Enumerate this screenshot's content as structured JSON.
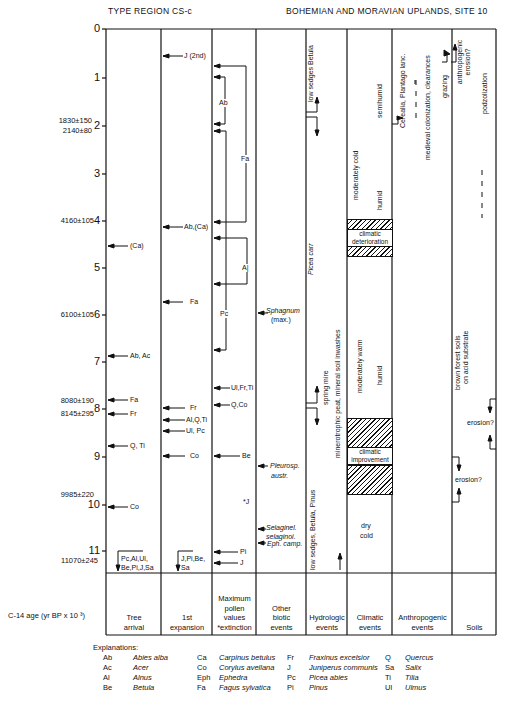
{
  "header": {
    "left_title": "TYPE REGION CS-c",
    "right_title": "BOHEMIAN AND MORAVIAN UPLANDS, SITE 10"
  },
  "axis": {
    "label": "C-14 age (yr BP x 10 ³)",
    "ticks": [
      "0",
      "1",
      "2",
      "3",
      "4",
      "5",
      "6",
      "7",
      "8",
      "9",
      "10",
      "11"
    ]
  },
  "dates": [
    {
      "text": "1830±150",
      "age": 1.83
    },
    {
      "text": "2140±80",
      "age": 2.14
    },
    {
      "text": "4160±105",
      "age": 4.16
    },
    {
      "text": "6100±105",
      "age": 6.1
    },
    {
      "text": "8080±190",
      "age": 8.08
    },
    {
      "text": "8145±295",
      "age": 8.145
    },
    {
      "text": "9985±220",
      "age": 9.985
    },
    {
      "text": "11070±245",
      "age": 11.07
    }
  ],
  "columns": [
    {
      "id": "tree-arrival",
      "label": "Tree\narrival"
    },
    {
      "id": "first-expansion",
      "label": "1st\nexpansion"
    },
    {
      "id": "max-pollen",
      "label": "Maximum\npollen\nvalues\n*extinction"
    },
    {
      "id": "other-biotic",
      "label": "Other\nbiotic\nevents"
    },
    {
      "id": "hydrologic",
      "label": "Hydrologic\nevents"
    },
    {
      "id": "climatic",
      "label": "Climatic\nevents"
    },
    {
      "id": "anthropogenic",
      "label": "Anthropogenic\nevents"
    },
    {
      "id": "soils",
      "label": "Soils"
    }
  ],
  "tree_arrival": [
    {
      "text": "(Ca)",
      "age": 4.55
    },
    {
      "text": "Ab, Ac",
      "age": 6.9
    },
    {
      "text": "Fa",
      "age": 7.85
    },
    {
      "text": "Fr",
      "age": 8.15
    },
    {
      "text": "Q, Ti",
      "age": 8.8
    },
    {
      "text": "Co",
      "age": 10.1
    },
    {
      "text": "Pc,Al,Ul,",
      "age": 11.2
    },
    {
      "text": "Be,Pi,J,Sa",
      "age": 11.4
    }
  ],
  "first_expansion": [
    {
      "text": "J (2nd)",
      "age": 0.55
    },
    {
      "text": "Ab,(Ca)",
      "age": 4.15
    },
    {
      "text": "Fa",
      "age": 5.75
    },
    {
      "text": "Fr",
      "age": 8.05
    },
    {
      "text": "Al,Q,Ti",
      "age": 8.3
    },
    {
      "text": "Ul, Pc",
      "age": 8.5
    },
    {
      "text": "Co",
      "age": 9.0
    },
    {
      "text": "J,Pi,Be,",
      "age": 11.2
    },
    {
      "text": "Sa",
      "age": 11.4
    }
  ],
  "max_pollen": [
    {
      "text": "Ab",
      "age": 1.5
    },
    {
      "text": "Fa",
      "age": 2.7
    },
    {
      "text": "A|",
      "age": 5.0
    },
    {
      "text": "Pc",
      "age": 6.0
    },
    {
      "text": "Ul,Fr,Ti",
      "age": 7.6
    },
    {
      "text": "Q,Co",
      "age": 7.95
    },
    {
      "text": "Be",
      "age": 9.0
    },
    {
      "text": "*J",
      "age": 9.95
    },
    {
      "text": "Pi",
      "age": 11.05
    },
    {
      "text": "J",
      "age": 11.3
    }
  ],
  "other_biotic": [
    {
      "text": "Sphagnum",
      "sub": "(max.)",
      "age": 5.95
    },
    {
      "text": "Pleurosp.",
      "sub": "austr.",
      "age": 9.2
    },
    {
      "text": "Selaginel.",
      "sub": "selaginoi.",
      "age": 10.6
    },
    {
      "text": "Eph. camp.",
      "age": 10.85
    }
  ],
  "hydrologic": [
    {
      "text": "low sedges Betula"
    },
    {
      "text": "Picea carr"
    },
    {
      "text": "spring mire"
    },
    {
      "text": "minerotrophic peat, mineral soil inwashes"
    },
    {
      "text": "low sedges, Betula, Pinus"
    }
  ],
  "climatic": [
    {
      "text": "moderately cold"
    },
    {
      "text": "semihumid"
    },
    {
      "text": "humid"
    },
    {
      "text": "climatic deterioration"
    },
    {
      "text": "moderately warm"
    },
    {
      "text": "humid"
    },
    {
      "text": "climatic improvement"
    },
    {
      "text": "dry"
    },
    {
      "text": "cold"
    }
  ],
  "anthropogenic": [
    {
      "text": "Cerealia, Plantago lanc."
    },
    {
      "text": "medieval colonization, clearances"
    },
    {
      "text": "grazing"
    },
    {
      "text": "anthropogenic erosion?"
    }
  ],
  "soils": [
    {
      "text": "podzolization"
    },
    {
      "text": "brown forest soils"
    },
    {
      "text": "on acid substrate"
    },
    {
      "text": "erosion?"
    },
    {
      "text": "erosion?"
    }
  ],
  "legend": {
    "title": "Explanations:",
    "entries": [
      [
        {
          "code": "Ab",
          "name": "Abies alba"
        },
        {
          "code": "Ca",
          "name": "Carpinus betulus"
        },
        {
          "code": "Fr",
          "name": "Fraxinus excelsior"
        },
        {
          "code": "Q",
          "name": "Quercus"
        }
      ],
      [
        {
          "code": "Ac",
          "name": "Acer"
        },
        {
          "code": "Co",
          "name": "Corylus avellana"
        },
        {
          "code": "J",
          "name": "Juniperus communis"
        },
        {
          "code": "Sa",
          "name": "Salix"
        }
      ],
      [
        {
          "code": "Al",
          "name": "Alnus"
        },
        {
          "code": "Eph",
          "name": "Ephedra"
        },
        {
          "code": "Pc",
          "name": "Picea abies"
        },
        {
          "code": "Ti",
          "name": "Tilia"
        }
      ],
      [
        {
          "code": "Be",
          "name": "Betula"
        },
        {
          "code": "Fa",
          "name": "Fagus sylvatica"
        },
        {
          "code": "Pi",
          "name": "Pinus"
        },
        {
          "code": "Ul",
          "name": "Ulmus"
        }
      ]
    ]
  }
}
